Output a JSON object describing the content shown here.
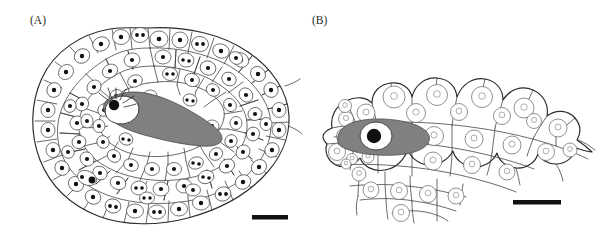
{
  "figure": {
    "type": "scientific-line-drawing",
    "background_color": "#ffffff",
    "ink_color": "#2a2a2a",
    "shaded_cell_color": "#808080",
    "nucleolus_color": "#111111",
    "panels": [
      {
        "id": "A",
        "label": "(A)",
        "label_x": 30,
        "label_y": 22,
        "outline_shape": "ovoid",
        "cell_count_approx": 95,
        "nucleus_style": "oval-with-dark-nucleoli",
        "shaded_cell": {
          "present": true,
          "fill": "#808080",
          "has_white_vacuole": true,
          "has_large_nucleolus": true,
          "has_radiating_rays": true
        },
        "scale_bar": {
          "x": 252,
          "y": 215,
          "width": 36,
          "height": 4.5,
          "color": "#111111"
        }
      },
      {
        "id": "B",
        "label": "(B)",
        "label_x": 312,
        "label_y": 22,
        "outline_shape": "scalloped-arch",
        "cell_count_approx": 42,
        "nucleus_style": "round-with-light-ring",
        "shaded_cell": {
          "present": true,
          "fill": "#808080",
          "has_white_vacuole": true,
          "has_large_nucleolus": true,
          "has_radiating_rays": false
        },
        "scale_bar": {
          "x": 513,
          "y": 200,
          "width": 48,
          "height": 4.5,
          "color": "#111111"
        }
      }
    ]
  }
}
